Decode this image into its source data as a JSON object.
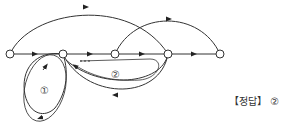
{
  "diagram": {
    "type": "signal-flow-graph",
    "nodes": [
      {
        "id": "n1",
        "x": 10,
        "y": 54
      },
      {
        "id": "n2",
        "x": 63,
        "y": 54
      },
      {
        "id": "n3",
        "x": 115,
        "y": 54
      },
      {
        "id": "n4",
        "x": 168,
        "y": 54
      },
      {
        "id": "n5",
        "x": 220,
        "y": 54
      }
    ],
    "loop_labels": [
      "①",
      "②"
    ],
    "colors": {
      "stroke": "#333333",
      "node_fill": "#ffffff"
    }
  },
  "answer": {
    "label": "【정답】 ②"
  }
}
